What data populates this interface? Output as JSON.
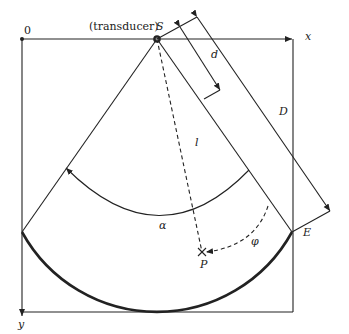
{
  "diagram": {
    "labels": {
      "origin": "0",
      "x_axis": "x",
      "y_axis": "y",
      "transducer": "(transducer)",
      "source": "S",
      "d": "d",
      "D": "D",
      "l": "l",
      "alpha": "α",
      "phi": "φ",
      "P": "P",
      "E": "E"
    },
    "colors": {
      "stroke": "#222222",
      "background": "#ffffff"
    }
  }
}
